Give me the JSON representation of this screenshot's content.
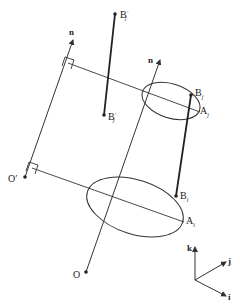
{
  "diagram": {
    "labels": {
      "n_left": "n",
      "n_right": "n",
      "B_j_prime_top": "B",
      "B_j_prime_top_sub": "j",
      "B_j_prime_top_prime": "′",
      "B_j_prime_mid": "B",
      "B_j_prime_mid_sub": "j",
      "B_j_prime_mid_prime": "′",
      "B_j": "B",
      "B_j_sub": "j",
      "A_j": "A",
      "A_j_sub": "j",
      "B_i": "B",
      "B_i_sub": "i",
      "A_i": "A",
      "A_i_sub": "i",
      "O_prime": "O′",
      "O": "O",
      "axis_k": "k",
      "axis_j": "j",
      "axis_i": "i"
    },
    "colors": {
      "stroke": "#333333",
      "text": "#222222",
      "background": "#ffffff"
    }
  }
}
